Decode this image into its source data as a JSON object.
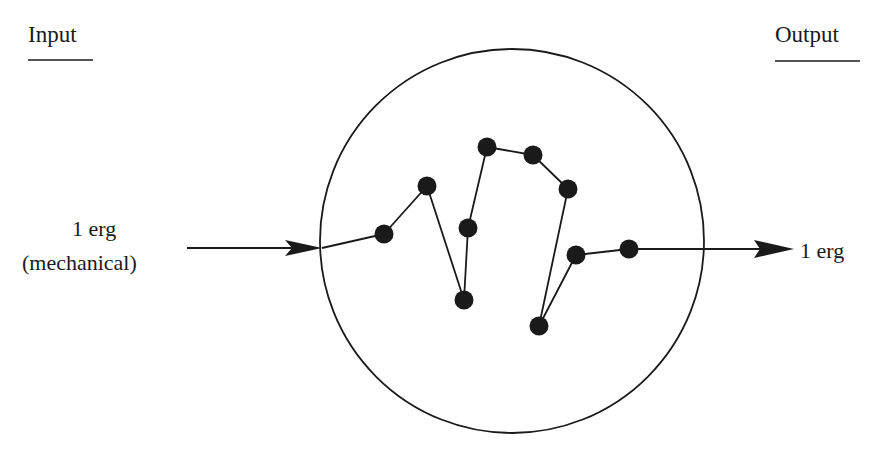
{
  "labels": {
    "input_heading": "Input",
    "output_heading": "Output",
    "input_value": "1 erg",
    "input_qualifier": "(mechanical)",
    "output_value": "1 erg"
  },
  "colors": {
    "ink": "#1a1a1a",
    "background": "#ffffff"
  },
  "system": {
    "shape": "circle",
    "center": [
      512,
      241
    ],
    "radius": 192
  },
  "nodes": [
    {
      "id": 1,
      "x": 384,
      "y": 234
    },
    {
      "id": 2,
      "x": 427,
      "y": 186
    },
    {
      "id": 3,
      "x": 464,
      "y": 300
    },
    {
      "id": 4,
      "x": 468,
      "y": 228
    },
    {
      "id": 5,
      "x": 487,
      "y": 147
    },
    {
      "id": 6,
      "x": 533,
      "y": 155
    },
    {
      "id": 7,
      "x": 568,
      "y": 189
    },
    {
      "id": 8,
      "x": 539,
      "y": 326
    },
    {
      "id": 9,
      "x": 576,
      "y": 255
    },
    {
      "id": 10,
      "x": 629,
      "y": 249
    }
  ],
  "path_order": [
    1,
    2,
    3,
    4,
    5,
    6,
    7,
    8,
    9,
    10
  ],
  "arrows": {
    "input": {
      "from": [
        187,
        248
      ],
      "to": [
        322,
        248
      ]
    },
    "input_inner_segment": {
      "from": [
        322,
        248
      ],
      "to": [
        384,
        234
      ]
    },
    "output": {
      "from": [
        629,
        249
      ],
      "to": [
        794,
        249
      ]
    }
  }
}
